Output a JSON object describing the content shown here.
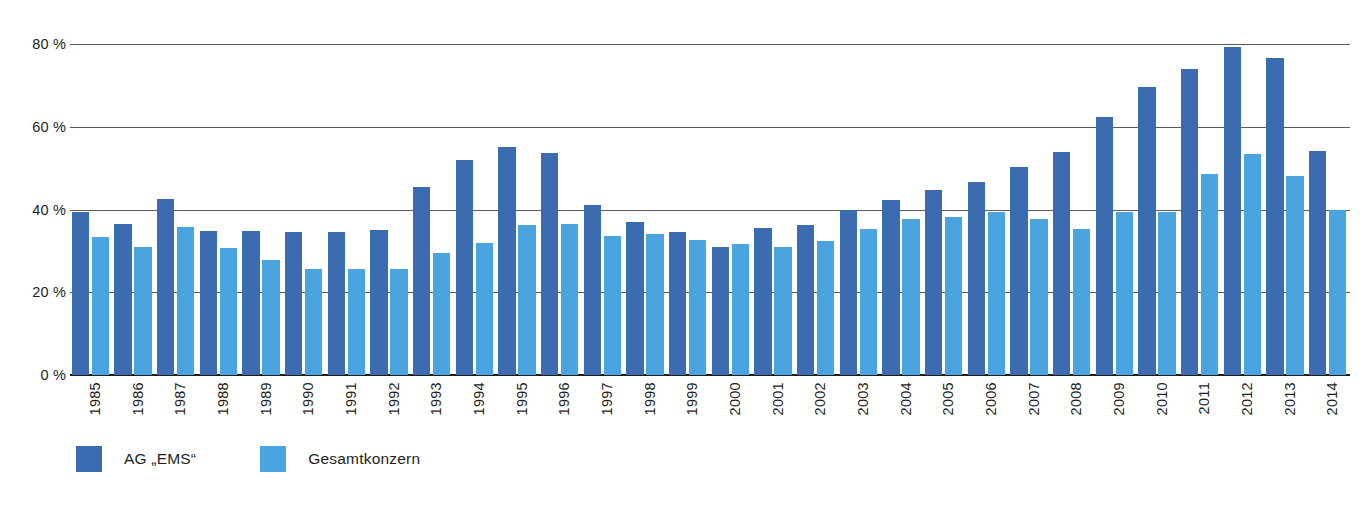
{
  "chart_data": {
    "type": "bar",
    "title": "",
    "subtitle": "",
    "xlabel": "",
    "ylabel": "",
    "ylim": [
      0,
      80
    ],
    "y_ticks": [
      0,
      20,
      40,
      60,
      80
    ],
    "y_tick_labels": [
      "0 %",
      "20 %",
      "40 %",
      "60 %",
      "80 %"
    ],
    "grid": true,
    "legend_position": "bottom-left",
    "categories": [
      "1985",
      "1986",
      "1987",
      "1988",
      "1989",
      "1990",
      "1991",
      "1992",
      "1993",
      "1994",
      "1995",
      "1996",
      "1997",
      "1998",
      "1999",
      "2000",
      "2001",
      "2002",
      "2003",
      "2004",
      "2005",
      "2006",
      "2007",
      "2008",
      "2009",
      "2010",
      "2011",
      "2012",
      "2013",
      "2014"
    ],
    "series": [
      {
        "name": "AG „EMS“",
        "color": "#3c6cb0",
        "values": [
          39.5,
          36.5,
          42.5,
          34.8,
          34.7,
          34.6,
          34.5,
          35.0,
          45.5,
          52.0,
          55.0,
          53.7,
          41.0,
          37.0,
          34.5,
          31.0,
          35.5,
          36.2,
          40.0,
          42.4,
          44.7,
          46.6,
          50.2,
          53.8,
          62.3,
          69.6,
          74.0,
          79.3,
          76.7,
          54.1
        ]
      },
      {
        "name": "Gesamtkonzern",
        "color": "#49a4df",
        "values": [
          33.3,
          31.0,
          35.8,
          30.7,
          27.8,
          25.7,
          25.6,
          25.7,
          29.4,
          32.0,
          36.3,
          36.6,
          33.6,
          34.2,
          32.6,
          31.7,
          30.9,
          32.3,
          35.2,
          37.6,
          38.3,
          39.4,
          37.6,
          35.2,
          39.3,
          39.3,
          48.6,
          53.5,
          48.1,
          39.8
        ]
      }
    ]
  },
  "legend": {
    "entries": [
      {
        "label": "AG „EMS“",
        "color": "#3c6cb0"
      },
      {
        "label": "Gesamtkonzern",
        "color": "#49a4df"
      }
    ]
  },
  "colors": {
    "series_dark": "#3c6cb0",
    "series_light": "#49a4df",
    "gridline": "#5a5a5a",
    "baseline": "#1c1c1c",
    "text": "#231f20",
    "background": "#ffffff"
  }
}
